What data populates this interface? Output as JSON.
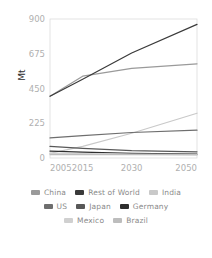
{
  "chart_data": {
    "type": "line",
    "title": "",
    "xlabel": "",
    "ylabel": "Mt",
    "x": [
      2005,
      2015,
      2030,
      2050
    ],
    "xtick_labels": [
      "2005",
      "2015",
      "2030",
      "2050"
    ],
    "ytick_labels": [
      "0",
      "225",
      "450",
      "675",
      "900"
    ],
    "yticks": [
      0,
      225,
      450,
      675,
      900
    ],
    "ylim": [
      0,
      900
    ],
    "xlim": [
      2005,
      2050
    ],
    "grid": false,
    "legend_position": "bottom",
    "series": [
      {
        "name": "China",
        "color": "#9a9a9a",
        "values": [
          400,
          530,
          580,
          610
        ]
      },
      {
        "name": "Rest of World",
        "color": "#3a3a3a",
        "values": [
          400,
          510,
          680,
          865
        ]
      },
      {
        "name": "India",
        "color": "#c9c9c9",
        "values": [
          30,
          75,
          160,
          290
        ]
      },
      {
        "name": "US",
        "color": "#6e6e6e",
        "values": [
          130,
          145,
          165,
          180
        ]
      },
      {
        "name": "Japan",
        "color": "#585858",
        "values": [
          75,
          62,
          48,
          40
        ]
      },
      {
        "name": "Germany",
        "color": "#2e2e2e",
        "values": [
          45,
          38,
          30,
          25
        ]
      },
      {
        "name": "Mexico",
        "color": "#d0d0d0",
        "values": [
          30,
          28,
          25,
          22
        ]
      },
      {
        "name": "Brazil",
        "color": "#bdbdbd",
        "values": [
          22,
          22,
          22,
          20
        ]
      }
    ]
  },
  "legend": {
    "rows": [
      [
        {
          "label": "China",
          "color": "#9a9a9a"
        },
        {
          "label": "Rest of World",
          "color": "#3a3a3a"
        },
        {
          "label": "India",
          "color": "#c9c9c9"
        }
      ],
      [
        {
          "label": "US",
          "color": "#6e6e6e"
        },
        {
          "label": "Japan",
          "color": "#585858"
        },
        {
          "label": "Germany",
          "color": "#2e2e2e"
        }
      ],
      [
        {
          "label": "Mexico",
          "color": "#d0d0d0"
        },
        {
          "label": "Brazil",
          "color": "#bdbdbd"
        }
      ]
    ]
  },
  "axis": {
    "tick_color": "#b0b0b0",
    "frame_color": "#dcdcdc",
    "label_color": "#2b2b2b"
  }
}
